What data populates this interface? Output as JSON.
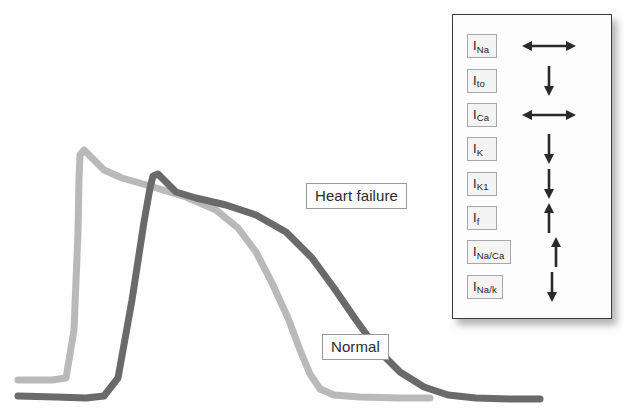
{
  "figure": {
    "background_color": "#fefefe",
    "normal_curve_color": "#b9b9b9",
    "heart_failure_curve_color": "#6a6a6a"
  },
  "chart_data": {
    "type": "line",
    "title": "",
    "subtitle": "",
    "xlabel": "",
    "ylabel": "",
    "grid": false,
    "axes_visible": false,
    "legend_position": "inline-annotations",
    "annotations": [
      {
        "text": "Heart failure",
        "x": 306,
        "y": 183,
        "boxed": true,
        "series": "Heart failure"
      },
      {
        "text": "Normal",
        "x": 322,
        "y": 334,
        "boxed": true,
        "series": "Normal"
      }
    ],
    "series": [
      {
        "name": "Normal",
        "color": "#b9b9b9",
        "line_width": 7,
        "description": "Normal cardiac action potential: rapid upstroke, brief plateau, earlier repolarization",
        "points": [
          [
            18,
            380
          ],
          [
            52,
            380
          ],
          [
            66,
            378
          ],
          [
            74,
            330
          ],
          [
            78,
            232
          ],
          [
            79,
            178
          ],
          [
            80,
            155
          ],
          [
            84,
            150
          ],
          [
            92,
            158
          ],
          [
            104,
            170
          ],
          [
            122,
            178
          ],
          [
            150,
            186
          ],
          [
            186,
            197
          ],
          [
            216,
            210
          ],
          [
            238,
            228
          ],
          [
            256,
            252
          ],
          [
            272,
            283
          ],
          [
            288,
            318
          ],
          [
            300,
            350
          ],
          [
            310,
            374
          ],
          [
            320,
            389
          ],
          [
            334,
            395
          ],
          [
            360,
            397
          ],
          [
            400,
            398
          ],
          [
            430,
            398
          ]
        ]
      },
      {
        "name": "Heart failure",
        "color": "#6a6a6a",
        "line_width": 7,
        "description": "Heart failure action potential: delayed upstroke, higher peak, prolonged plateau and markedly delayed repolarization",
        "points": [
          [
            18,
            396
          ],
          [
            56,
            397
          ],
          [
            86,
            398
          ],
          [
            104,
            396
          ],
          [
            118,
            378
          ],
          [
            132,
            300
          ],
          [
            144,
            222
          ],
          [
            150,
            188
          ],
          [
            153,
            176
          ],
          [
            158,
            174
          ],
          [
            166,
            182
          ],
          [
            176,
            192
          ],
          [
            196,
            198
          ],
          [
            226,
            205
          ],
          [
            256,
            215
          ],
          [
            286,
            232
          ],
          [
            312,
            258
          ],
          [
            334,
            288
          ],
          [
            356,
            320
          ],
          [
            378,
            350
          ],
          [
            400,
            372
          ],
          [
            424,
            387
          ],
          [
            448,
            395
          ],
          [
            476,
            398
          ],
          [
            510,
            399
          ],
          [
            540,
            399
          ]
        ]
      }
    ],
    "xlim": [
      0,
      560
    ],
    "ylim": [
      415,
      140
    ]
  },
  "legend_panel": {
    "title": "",
    "rows": [
      {
        "current": "I",
        "subscript": "Na",
        "change": "unchanged",
        "arrow_icon": "double-horizontal-arrow-icon"
      },
      {
        "current": "I",
        "subscript": "to",
        "change": "decreased",
        "arrow_icon": "down-arrow-icon"
      },
      {
        "current": "I",
        "subscript": "Ca",
        "change": "unchanged",
        "arrow_icon": "double-horizontal-arrow-icon"
      },
      {
        "current": "I",
        "subscript": "K",
        "change": "decreased",
        "arrow_icon": "down-arrow-icon"
      },
      {
        "current": "I",
        "subscript": "K1",
        "change": "decreased",
        "arrow_icon": "down-arrow-icon"
      },
      {
        "current": "I",
        "subscript": "f",
        "change": "increased",
        "arrow_icon": "up-arrow-icon"
      },
      {
        "current": "I",
        "subscript": "Na/Ca",
        "change": "increased",
        "arrow_icon": "up-arrow-icon"
      },
      {
        "current": "I",
        "subscript": "Na/k",
        "change": "decreased",
        "arrow_icon": "down-arrow-icon"
      }
    ]
  }
}
